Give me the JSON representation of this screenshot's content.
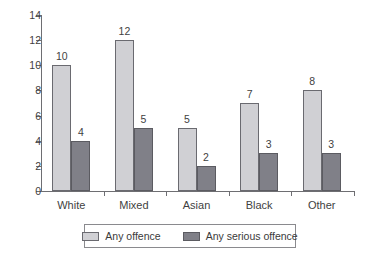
{
  "chart_data": {
    "type": "bar",
    "title": "",
    "subtitle": "",
    "xlabel": "",
    "ylabel": "",
    "categories": [
      "White",
      "Mixed",
      "Asian",
      "Black",
      "Other"
    ],
    "series": [
      {
        "name": "Any offence",
        "color": "#d0d0d4",
        "values": [
          10,
          12,
          5,
          7,
          8
        ]
      },
      {
        "name": "Any serious offence",
        "color": "#808088",
        "values": [
          4,
          5,
          2,
          3,
          3
        ]
      }
    ],
    "yticks": [
      0,
      2,
      4,
      6,
      8,
      10,
      12,
      14
    ],
    "ytick_labels": [
      "0",
      "2",
      "4",
      "6",
      "8",
      "10",
      "12",
      "14"
    ],
    "ylim": [
      0,
      14
    ],
    "grid": false,
    "legend_position": "bottom-center",
    "data_labels_shown": true,
    "data_labels": {
      "Any offence": [
        "10",
        "12",
        "5",
        "7",
        "8"
      ],
      "Any serious offence": [
        "4",
        "5",
        "2",
        "3",
        "3"
      ]
    }
  },
  "legend": {
    "entries": [
      {
        "label": "Any offence",
        "swatch": "light-gray-swatch-icon"
      },
      {
        "label": "Any serious offence",
        "swatch": "dark-gray-swatch-icon"
      }
    ]
  },
  "colors": {
    "series_light": "#d0d0d4",
    "series_dark": "#808088",
    "axis": "#6e6e72",
    "text": "#3f3f3f",
    "background": "#ffffff"
  }
}
